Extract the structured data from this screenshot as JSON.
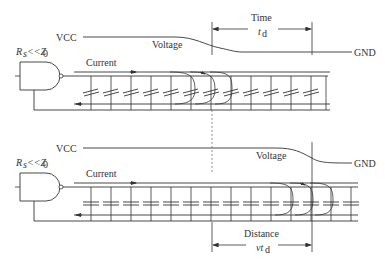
{
  "diagram": {
    "top_panel": {
      "vcc_label": "VCC",
      "gnd_label": "GND",
      "voltage_label": "Voltage",
      "current_label": "Current",
      "source_label_R": "R",
      "source_label_sub": "s",
      "source_label_rel": "<<Z",
      "source_label_z_sub": "0",
      "time_label": "Time",
      "time_value_t": "t",
      "time_value_sub": "d"
    },
    "bottom_panel": {
      "vcc_label": "VCC",
      "gnd_label": "GND",
      "voltage_label": "Voltage",
      "current_label": "Current",
      "source_label_R": "R",
      "source_label_sub": "s",
      "source_label_rel": "<<Z",
      "source_label_z_sub": "0",
      "distance_label": "Distance",
      "distance_value_vt": "vt",
      "distance_value_sub": "d"
    },
    "colors": {
      "line": "#333333",
      "dashed": "#777777",
      "background": "#ffffff"
    }
  }
}
